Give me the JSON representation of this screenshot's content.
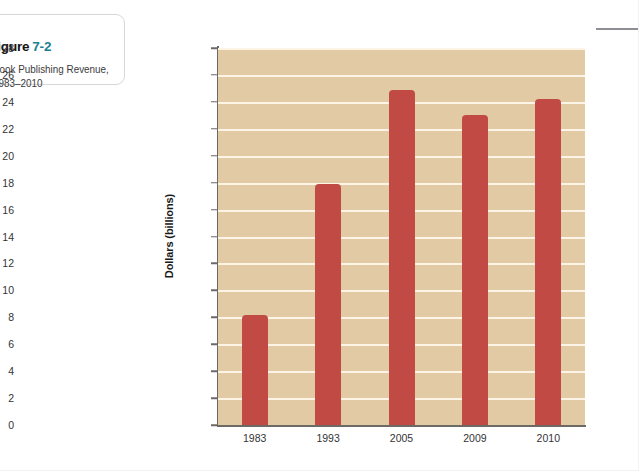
{
  "figure": {
    "label_word": "figure",
    "number": "7-2",
    "caption": "Book Publishing Revenue, 1983–2010",
    "number_color": "#1b7f92"
  },
  "chart_data": {
    "type": "bar",
    "title": "",
    "xlabel": "",
    "ylabel": "Dollars (billions)",
    "categories": [
      "1983",
      "1993",
      "2005",
      "2009",
      "2010"
    ],
    "values": [
      8.2,
      17.9,
      24.9,
      23.0,
      24.2
    ],
    "ylim": [
      0,
      28
    ],
    "ytick_step": 2,
    "yticks": [
      0,
      2,
      4,
      6,
      8,
      10,
      12,
      14,
      16,
      18,
      20,
      22,
      24,
      26,
      28
    ],
    "grid": true,
    "legend": "none",
    "bar_color": "#c14a44",
    "plot_background": "#e2cba4",
    "gridline_color": "#fbf4e7",
    "axis_color": "#6d6a66"
  }
}
